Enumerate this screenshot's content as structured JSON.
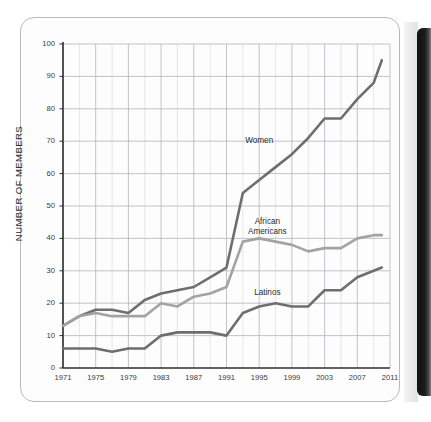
{
  "page": {
    "frame": "rounded-page-border",
    "binding": "dark-book-spine-strip"
  },
  "chart_data": {
    "type": "line",
    "title": "",
    "subtitle": "",
    "xlabel": "",
    "ylabel": "NUMBER OF MEMBERS",
    "xlim": [
      1971,
      2011
    ],
    "ylim": [
      0,
      100
    ],
    "grid": true,
    "legend_position": "inline-annotations",
    "y_ticks": [
      0,
      10,
      20,
      30,
      40,
      50,
      60,
      70,
      80,
      90,
      100
    ],
    "x_ticks": [
      1971,
      1975,
      1979,
      1983,
      1987,
      1991,
      1995,
      1999,
      2003,
      2007,
      2011
    ],
    "x_minor_step": 2,
    "x": [
      1971,
      1973,
      1975,
      1977,
      1979,
      1981,
      1983,
      1985,
      1987,
      1989,
      1991,
      1993,
      1995,
      1997,
      1999,
      2001,
      2003,
      2005,
      2007,
      2009,
      2010
    ],
    "series": [
      {
        "name": "Women",
        "color": "#6e6e6e",
        "values": [
          13,
          16,
          18,
          18,
          17,
          21,
          23,
          24,
          25,
          28,
          31,
          54,
          58,
          62,
          66,
          71,
          77,
          77,
          83,
          88,
          95
        ]
      },
      {
        "name": "African Americans",
        "color": "#a3a3a3",
        "values": [
          13,
          16,
          17,
          16,
          16,
          16,
          20,
          19,
          22,
          23,
          25,
          39,
          40,
          39,
          38,
          36,
          37,
          37,
          40,
          41,
          41
        ]
      },
      {
        "name": "Latinos",
        "color": "#6e6e6e",
        "values": [
          6,
          6,
          6,
          5,
          6,
          6,
          10,
          11,
          11,
          11,
          10,
          17,
          19,
          20,
          19,
          19,
          24,
          24,
          28,
          30,
          31
        ]
      }
    ],
    "annotations": [
      {
        "text": "Women",
        "x": 1995,
        "y": 70
      },
      {
        "text": "African",
        "x": 1996,
        "y": 45
      },
      {
        "text": "Americans",
        "x": 1996,
        "y": 42
      },
      {
        "text": "Latinos",
        "x": 1996,
        "y": 23
      }
    ]
  }
}
